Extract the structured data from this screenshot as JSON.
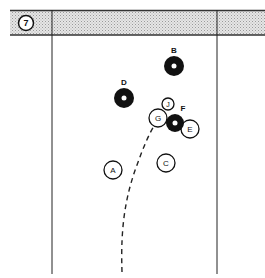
{
  "diagram": {
    "number": "7",
    "colors": {
      "header_fill": "#d4d4d4",
      "line": "#222222",
      "stone_dark": "#111111",
      "stone_light": "#ffffff"
    },
    "stones": [
      {
        "id": "A",
        "type": "light",
        "cx": 113,
        "cy": 170,
        "r": 9
      },
      {
        "id": "B",
        "type": "dark",
        "cx": 174,
        "cy": 66,
        "r": 10
      },
      {
        "id": "C",
        "type": "light",
        "cx": 166,
        "cy": 163,
        "r": 9
      },
      {
        "id": "D",
        "type": "dark",
        "cx": 124,
        "cy": 98,
        "r": 10
      },
      {
        "id": "E",
        "type": "light",
        "cx": 190,
        "cy": 129,
        "r": 9
      },
      {
        "id": "F",
        "type": "dark",
        "cx": 175,
        "cy": 123,
        "r": 9
      },
      {
        "id": "G",
        "type": "light",
        "cx": 158,
        "cy": 118,
        "r": 9
      },
      {
        "id": "J",
        "type": "light",
        "cx": 168,
        "cy": 104,
        "r": 6
      }
    ],
    "path": "dashed curved delivery line from bottom center toward stone G"
  }
}
